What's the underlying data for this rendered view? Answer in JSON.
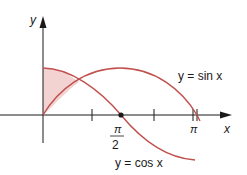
{
  "figure": {
    "type": "function-graph",
    "colors": {
      "curve": "#c0504d",
      "shade": "#f2d3d1",
      "axis": "#1a1a1a"
    }
  },
  "axes": {
    "x_label": "x",
    "y_label": "y"
  },
  "ticks": {
    "half_pi_num": "π",
    "half_pi_den": "2",
    "pi": "π"
  },
  "curves": [
    {
      "name": "sin",
      "label": "y = sin x"
    },
    {
      "name": "cos",
      "label": "y = cos x"
    }
  ],
  "shaded_region": {
    "from": "0",
    "to": "π/4",
    "between": [
      "cos x",
      "sin x"
    ]
  }
}
